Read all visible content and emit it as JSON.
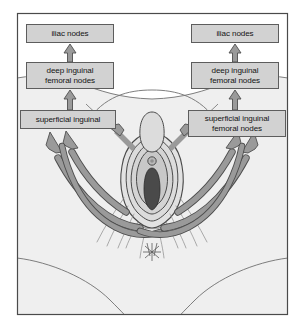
{
  "figure": {
    "frame_color": "#4a4a4a",
    "background_color": "#ffffff"
  },
  "colors": {
    "box_fill": "#d2d2d2",
    "box_stroke": "#5d5d5d",
    "arrow_fill": "#9a9a9a",
    "arrow_stroke": "#4e4e4e",
    "skin_fill": "#efefef",
    "skin_stroke": "#6f6f6f",
    "labia_outer": "#e2e2e2",
    "labia_mid": "#d8d8d8",
    "labia_inner": "#c8c8c8",
    "introitus": "#4a4a4a",
    "hair_stroke": "#8a8a8a"
  },
  "nodes": {
    "iliac_left": {
      "label": "iliac nodes"
    },
    "iliac_right": {
      "label": "iliac nodes"
    },
    "deep_left": {
      "label": "deep inguinal\nfemoral nodes"
    },
    "deep_right": {
      "label": "deep inguinal\nfemoral nodes"
    },
    "superficial_left": {
      "label": "superficial inguinal"
    },
    "superficial_right": {
      "label": "superficial inguinal\nfemoral nodes"
    }
  },
  "arrows": {
    "vertical": [
      {
        "name": "superficial-left-to-deep-left"
      },
      {
        "name": "deep-left-to-iliac-left"
      },
      {
        "name": "superficial-right-to-deep-right"
      },
      {
        "name": "deep-right-to-iliac-right"
      }
    ],
    "curved": [
      {
        "name": "vulva-to-superficial-left-upper"
      },
      {
        "name": "vulva-to-superficial-left-mid"
      },
      {
        "name": "vulva-to-superficial-left-lower"
      },
      {
        "name": "vulva-to-superficial-right-upper"
      },
      {
        "name": "vulva-to-superficial-right-mid"
      },
      {
        "name": "vulva-to-superficial-right-lower"
      },
      {
        "name": "contralateral-crossover-left"
      },
      {
        "name": "contralateral-crossover-right"
      }
    ]
  },
  "anatomy": {
    "parts": [
      {
        "name": "mons-pubis"
      },
      {
        "name": "labia-majora"
      },
      {
        "name": "labia-minora"
      },
      {
        "name": "clitoris"
      },
      {
        "name": "vaginal-introitus"
      },
      {
        "name": "perineum"
      },
      {
        "name": "anus"
      },
      {
        "name": "buttock-left"
      },
      {
        "name": "buttock-right"
      },
      {
        "name": "thigh-crease-left"
      },
      {
        "name": "thigh-crease-right"
      },
      {
        "name": "pubic-hair"
      }
    ]
  }
}
